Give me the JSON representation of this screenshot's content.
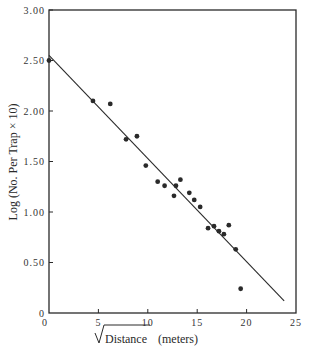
{
  "chart_data": {
    "type": "scatter",
    "title": "",
    "xlabel": "√Distance (meters)",
    "xlabel_radicand": "Distance",
    "xlabel_units": "(meters)",
    "ylabel": "Log (No. Per Trap × 10)",
    "xlim": [
      0,
      25
    ],
    "ylim": [
      0,
      3.0
    ],
    "x_ticks": [
      0,
      5,
      10,
      15,
      20,
      25
    ],
    "x_tick_labels": [
      "0",
      "5",
      "10",
      "15",
      "20",
      "25"
    ],
    "y_ticks": [
      0,
      0.5,
      1.0,
      1.5,
      2.0,
      2.5,
      3.0
    ],
    "y_tick_labels": [
      "0",
      "0.50",
      "1.00",
      "1.50",
      "2.00",
      "2.50",
      "3.00"
    ],
    "grid": false,
    "legend": null,
    "series": [
      {
        "name": "observations",
        "points": [
          {
            "x": 0.0,
            "y": 2.5
          },
          {
            "x": 4.45,
            "y": 2.1
          },
          {
            "x": 6.2,
            "y": 2.07
          },
          {
            "x": 7.8,
            "y": 1.72
          },
          {
            "x": 8.9,
            "y": 1.75
          },
          {
            "x": 9.8,
            "y": 1.46
          },
          {
            "x": 11.0,
            "y": 1.3
          },
          {
            "x": 11.7,
            "y": 1.26
          },
          {
            "x": 12.65,
            "y": 1.16
          },
          {
            "x": 12.85,
            "y": 1.26
          },
          {
            "x": 13.3,
            "y": 1.32
          },
          {
            "x": 14.2,
            "y": 1.19
          },
          {
            "x": 14.7,
            "y": 1.12
          },
          {
            "x": 15.3,
            "y": 1.05
          },
          {
            "x": 16.1,
            "y": 0.84
          },
          {
            "x": 16.7,
            "y": 0.86
          },
          {
            "x": 17.2,
            "y": 0.81
          },
          {
            "x": 17.7,
            "y": 0.78
          },
          {
            "x": 18.2,
            "y": 0.87
          },
          {
            "x": 18.9,
            "y": 0.63
          },
          {
            "x": 19.4,
            "y": 0.24
          }
        ]
      }
    ],
    "fit_line": {
      "x0": 0.0,
      "y0": 2.55,
      "x1": 23.8,
      "y1": 0.12
    }
  },
  "colors": {
    "ink": "#2a2a2a",
    "background": "#ffffff"
  }
}
